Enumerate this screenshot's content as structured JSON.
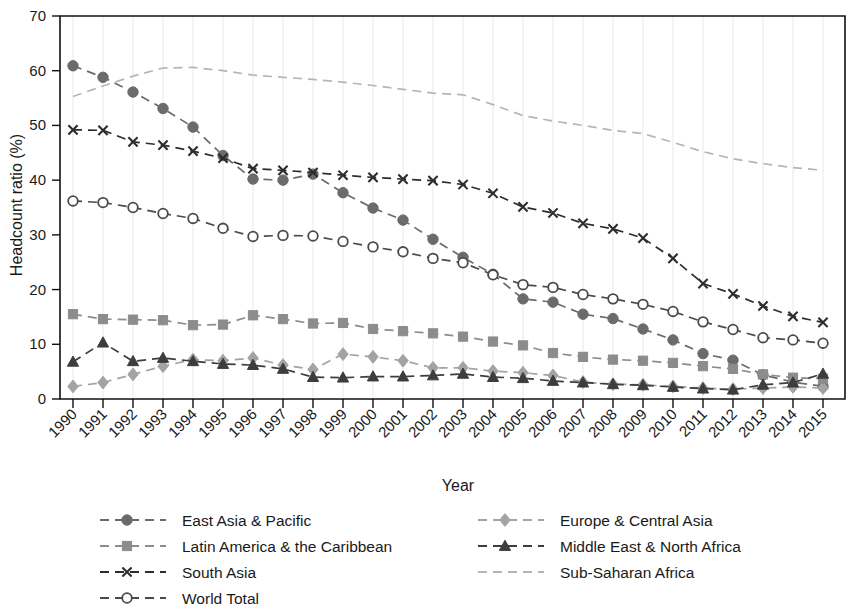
{
  "chart_data": {
    "type": "line",
    "title": "",
    "xlabel": "Year",
    "ylabel": "Headcount ratio (%)",
    "xlim": [
      1990,
      2015
    ],
    "ylim": [
      0,
      70
    ],
    "yticks": [
      0,
      10,
      20,
      30,
      40,
      50,
      60,
      70
    ],
    "grid": true,
    "grid_axis": "x",
    "legend_position": "bottom",
    "categories": [
      1990,
      1991,
      1992,
      1993,
      1994,
      1995,
      1996,
      1997,
      1998,
      1999,
      2000,
      2001,
      2002,
      2003,
      2004,
      2005,
      2006,
      2007,
      2008,
      2009,
      2010,
      2011,
      2012,
      2013,
      2014,
      2015
    ],
    "series": [
      {
        "name": "East Asia & Pacific",
        "marker": "filled-circle",
        "color": "#6b6b6b",
        "values": [
          60.9,
          58.8,
          56.1,
          53.1,
          49.7,
          44.5,
          40.2,
          40.0,
          41.1,
          37.7,
          34.9,
          32.7,
          29.2,
          25.9,
          22.8,
          18.3,
          17.7,
          15.5,
          14.7,
          12.8,
          10.8,
          8.3,
          7.1,
          4.4,
          3.1,
          2.3
        ]
      },
      {
        "name": "Europe & Central Asia",
        "marker": "filled-diamond",
        "color": "#a3a3a3",
        "values": [
          2.3,
          3.0,
          4.5,
          6.0,
          7.2,
          7.0,
          7.5,
          6.2,
          5.4,
          8.2,
          7.7,
          7.0,
          5.7,
          5.7,
          5.1,
          4.8,
          4.3,
          3.1,
          2.7,
          2.6,
          2.3,
          2.0,
          1.8,
          2.0,
          2.2,
          2.0
        ]
      },
      {
        "name": "Latin America & the Caribbean",
        "marker": "filled-square",
        "color": "#8c8c8c",
        "values": [
          15.5,
          14.6,
          14.5,
          14.4,
          13.5,
          13.6,
          15.3,
          14.6,
          13.8,
          13.9,
          12.8,
          12.4,
          12.0,
          11.4,
          10.5,
          9.8,
          8.4,
          7.7,
          7.2,
          7.0,
          6.6,
          6.0,
          5.5,
          4.5,
          3.9,
          3.7
        ]
      },
      {
        "name": "Middle East & North Africa",
        "marker": "filled-triangle",
        "color": "#3d3d3d",
        "values": [
          6.8,
          10.3,
          6.9,
          7.5,
          6.9,
          6.4,
          6.2,
          5.5,
          4.0,
          3.9,
          4.1,
          4.1,
          4.3,
          4.6,
          4.0,
          3.8,
          3.3,
          3.0,
          2.7,
          2.5,
          2.2,
          1.9,
          1.7,
          2.6,
          3.0,
          4.6
        ]
      },
      {
        "name": "South Asia",
        "marker": "cross",
        "color": "#2d2d2d",
        "values": [
          49.2,
          49.1,
          47.0,
          46.4,
          45.3,
          44.0,
          42.1,
          41.8,
          41.4,
          40.9,
          40.5,
          40.2,
          39.9,
          39.2,
          37.6,
          35.1,
          34.0,
          32.1,
          31.1,
          29.4,
          25.7,
          21.1,
          19.2,
          17.0,
          15.1,
          14.0
        ]
      },
      {
        "name": "Sub-Saharan Africa",
        "marker": "none",
        "color": "#b5b5b5",
        "values": [
          55.3,
          57.2,
          59.0,
          60.5,
          60.6,
          60.0,
          59.2,
          58.8,
          58.4,
          57.9,
          57.3,
          56.6,
          55.9,
          55.6,
          53.8,
          51.8,
          50.8,
          50.0,
          49.1,
          48.5,
          46.9,
          45.2,
          43.9,
          43.0,
          42.3,
          41.8
        ]
      },
      {
        "name": "World Total",
        "marker": "open-circle",
        "color": "#4a4a4a",
        "values": [
          36.2,
          35.9,
          35.0,
          33.9,
          33.0,
          31.2,
          29.7,
          29.9,
          29.8,
          28.8,
          27.8,
          26.9,
          25.7,
          24.9,
          22.7,
          20.9,
          20.4,
          19.1,
          18.3,
          17.3,
          16.0,
          14.1,
          12.7,
          11.2,
          10.8,
          10.2
        ]
      }
    ],
    "legend": [
      {
        "name": "East Asia & Pacific",
        "marker": "filled-circle",
        "color": "#6b6b6b",
        "col": 0,
        "row": 0
      },
      {
        "name": "Latin America & the Caribbean",
        "marker": "filled-square",
        "color": "#8c8c8c",
        "col": 0,
        "row": 1
      },
      {
        "name": "South Asia",
        "marker": "cross",
        "color": "#2d2d2d",
        "col": 0,
        "row": 2
      },
      {
        "name": "World Total",
        "marker": "open-circle",
        "color": "#4a4a4a",
        "col": 0,
        "row": 3
      },
      {
        "name": "Europe & Central Asia",
        "marker": "filled-diamond",
        "color": "#a3a3a3",
        "col": 1,
        "row": 0
      },
      {
        "name": "Middle East & North Africa",
        "marker": "filled-triangle",
        "color": "#3d3d3d",
        "col": 1,
        "row": 1
      },
      {
        "name": "Sub-Saharan Africa",
        "marker": "none",
        "color": "#b5b5b5",
        "col": 1,
        "row": 2
      }
    ]
  }
}
